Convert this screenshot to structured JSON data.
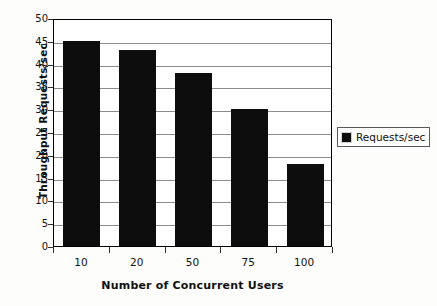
{
  "chart_data": {
    "type": "bar",
    "title": "",
    "xlabel": "Number of Concurrent Users",
    "ylabel": "Throughput Requests/sec",
    "categories": [
      "10",
      "20",
      "50",
      "75",
      "100"
    ],
    "values": [
      45,
      43,
      38,
      30,
      18
    ],
    "series": [
      {
        "name": "Requests/sec",
        "values": [
          45,
          43,
          38,
          30,
          18
        ],
        "color": "#0d0d0d"
      }
    ],
    "ylim": [
      0,
      50
    ],
    "ytick_labels": [
      "50",
      "45",
      "40",
      "35",
      "30",
      "25",
      "20",
      "15",
      "10",
      "5",
      "0"
    ],
    "ytick_values": [
      50,
      45,
      40,
      35,
      30,
      25,
      20,
      15,
      10,
      5,
      0
    ],
    "ytick_step": 5,
    "grid": true,
    "grid_axis": "y",
    "grid_color": "#8d8d8d",
    "legend": {
      "position": "right",
      "entries": [
        {
          "label": "Requests/sec",
          "marker": "filled-square",
          "color": "#0d0d0d"
        }
      ]
    },
    "plot_background": "#ffffff",
    "figure_background": "#fdfdfb",
    "axis_color": "#000000"
  },
  "icons": {
    "legend_marker": "filled-square-icon"
  }
}
